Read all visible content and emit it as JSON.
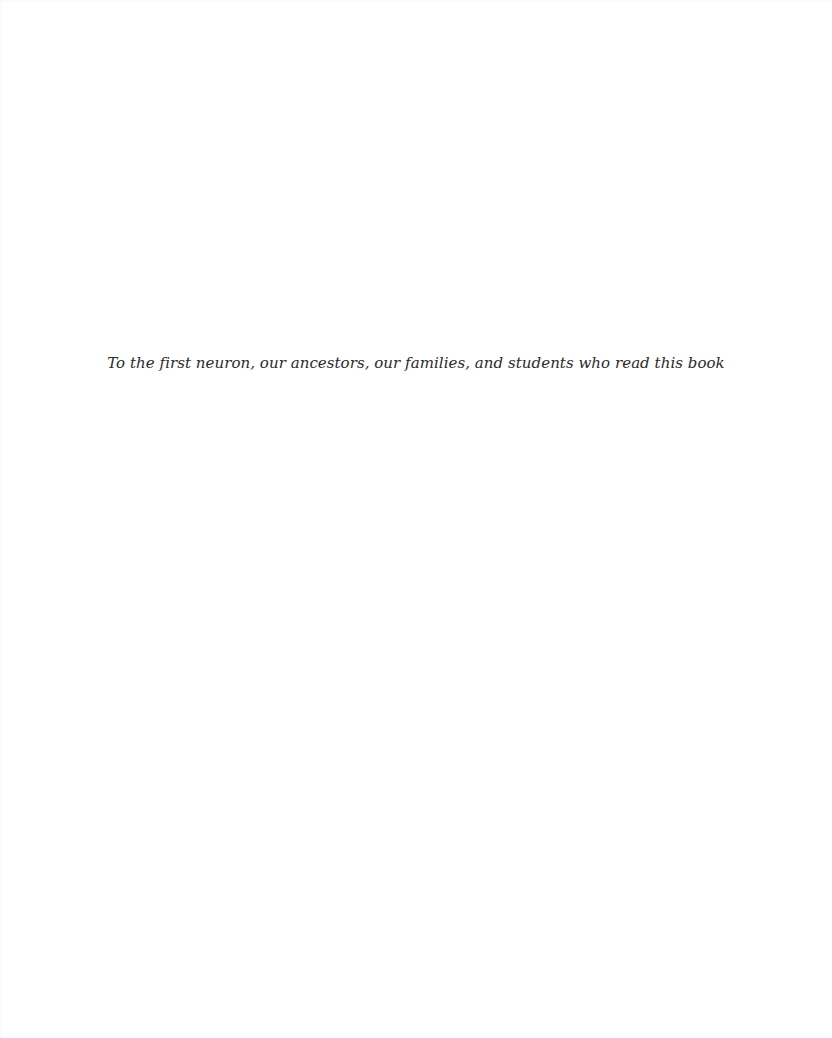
{
  "page": {
    "dedication": "To the first neuron, our ancestors, our families, and students who read this book"
  },
  "colors": {
    "background": "#ffffff",
    "text": "#2a2a2a"
  }
}
